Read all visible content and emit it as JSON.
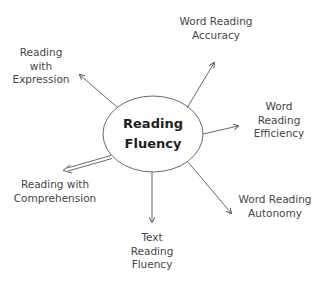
{
  "diagram": {
    "center": {
      "lines": [
        "Reading",
        "Fluency"
      ]
    },
    "nodes": [
      {
        "id": "expression",
        "lines": [
          "Reading",
          "with",
          "Expression"
        ],
        "arrow": "single"
      },
      {
        "id": "accuracy",
        "lines": [
          "Word Reading",
          "Accuracy"
        ],
        "arrow": "single"
      },
      {
        "id": "efficiency",
        "lines": [
          "Word",
          "Reading",
          "Efficiency"
        ],
        "arrow": "single"
      },
      {
        "id": "autonomy",
        "lines": [
          "Word Reading",
          "Autonomy"
        ],
        "arrow": "single"
      },
      {
        "id": "text-fluency",
        "lines": [
          "Text",
          "Reading",
          "Fluency"
        ],
        "arrow": "single"
      },
      {
        "id": "comprehension",
        "lines": [
          "Reading with",
          "Comprehension"
        ],
        "arrow": "double"
      }
    ],
    "colors": {
      "line": "#6a6a6a",
      "text": "#454545",
      "center_text": "#1e1e1e",
      "background": "#ffffff"
    }
  }
}
